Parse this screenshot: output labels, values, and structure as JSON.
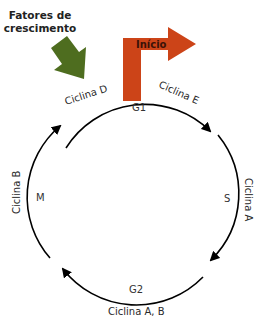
{
  "diagram": {
    "growth_factors": {
      "line1": "Fatores de",
      "line2": "crescimento",
      "arrow_color": "#4e6d1f"
    },
    "start": {
      "label": "Início",
      "arrow_color": "#cc4418"
    },
    "phases": {
      "g1": "G1",
      "s": "S",
      "g2": "G2",
      "m": "M"
    },
    "cyclins": {
      "d": "Ciclina D",
      "e": "Ciclina E",
      "a": "Ciclina A",
      "ab": "Ciclina A, B",
      "b": "Ciclina B"
    },
    "cycle_line_color": "#000000"
  }
}
